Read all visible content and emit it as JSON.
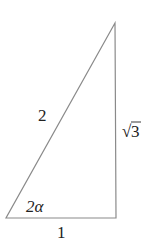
{
  "diagram": {
    "type": "right-triangle",
    "stroke_color": "#8a8a8a",
    "vertices": {
      "top": [
        115,
        23
      ],
      "bottom_left": [
        6,
        218
      ],
      "bottom_right": [
        116,
        218
      ]
    },
    "labels": {
      "hypotenuse": "2",
      "vertical_side_radical": "√",
      "vertical_side_value": "3",
      "angle": "2α",
      "base": "1"
    }
  }
}
